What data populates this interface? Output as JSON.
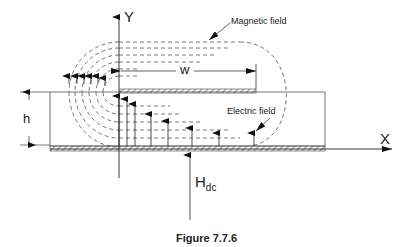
{
  "figure": {
    "caption": "Figure 7.7.6",
    "axes": {
      "y_label": "Y",
      "x_label": "X"
    },
    "dimensions": {
      "width_label": "w",
      "height_label": "h"
    },
    "annotations": {
      "magnetic_field": "Magnetic field",
      "electric_field": "Electric field",
      "bias_field": "H",
      "bias_field_subscript": "dc"
    },
    "colors": {
      "line": "#222222",
      "dashed": "#555555",
      "hatch": "#444444"
    }
  }
}
